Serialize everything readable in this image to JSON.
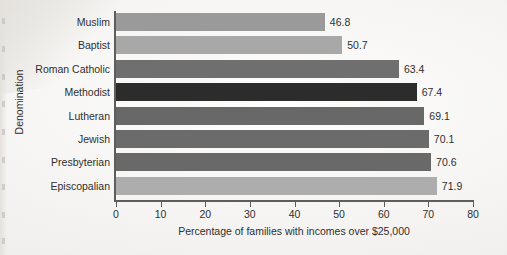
{
  "chart_data": {
    "type": "bar",
    "orientation": "horizontal",
    "title": "",
    "xlabel": "Percentage of families with incomes over $25,000",
    "ylabel": "Denomination",
    "categories": [
      "Muslim",
      "Baptist",
      "Roman Catholic",
      "Methodist",
      "Lutheran",
      "Jewish",
      "Presbyterian",
      "Episcopalian"
    ],
    "values": [
      46.8,
      50.7,
      63.4,
      67.4,
      69.1,
      70.1,
      70.6,
      71.9
    ],
    "value_labels": [
      "46.8",
      "50.7",
      "63.4",
      "67.4",
      "69.1",
      "70.1",
      "70.6",
      "71.9"
    ],
    "bar_colors": [
      "#9a9a9a",
      "#a8a8a8",
      "#6f6f6f",
      "#2c2c2c",
      "#686868",
      "#6b6b6b",
      "#696969",
      "#adadad"
    ],
    "xlim": [
      0,
      80
    ],
    "xticks": [
      0,
      10,
      20,
      30,
      40,
      50,
      60,
      70,
      80
    ],
    "xtick_labels": [
      "0",
      "10",
      "20",
      "30",
      "40",
      "50",
      "60",
      "70",
      "80"
    ],
    "grid": false,
    "legend": false,
    "axis_color": "#5d5d5d",
    "background_color": "#f2f1ef"
  }
}
